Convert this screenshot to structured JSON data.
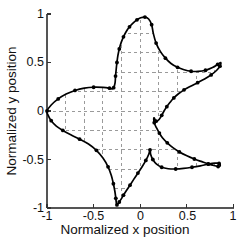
{
  "figure": {
    "background": "#ffffff",
    "axis_color": "#4d4d4d",
    "grid_color": "#9a9a9a",
    "curve_color": "#000000",
    "marker_color": "#000000"
  },
  "chart_data": {
    "type": "line",
    "title": "",
    "xlabel": "Normalized x position",
    "ylabel": "Normalized y position",
    "xlim": [
      -1,
      1
    ],
    "ylim": [
      -1,
      1
    ],
    "xticks": [
      -1,
      -0.5,
      0,
      0.5,
      1
    ],
    "yticks": [
      -1,
      -0.5,
      0,
      0.5,
      1
    ],
    "xtick_labels": [
      "-1",
      "-0.5",
      "0",
      "0.5",
      "1"
    ],
    "ytick_labels": [
      "-1",
      "-0.5",
      "0",
      "0.5",
      "1"
    ],
    "grid": true,
    "grid_style": "dashed",
    "grid_minor_step": 0.2,
    "legend": null,
    "annotations": [],
    "series": [
      {
        "name": "normalized cell outline",
        "style": "line-with-markers",
        "marker": "dot",
        "closed": true,
        "x": [
          -1.0,
          -0.955,
          -0.88,
          -0.795,
          -0.7,
          -0.6,
          -0.5,
          -0.4,
          -0.33,
          -0.3,
          -0.285,
          -0.27,
          -0.265,
          -0.258,
          -0.25,
          -0.24,
          -0.225,
          -0.205,
          -0.18,
          -0.15,
          -0.115,
          -0.075,
          -0.035,
          0.005,
          0.05,
          0.09,
          0.122,
          0.14,
          0.17,
          0.215,
          0.27,
          0.33,
          0.4,
          0.47,
          0.545,
          0.62,
          0.7,
          0.775,
          0.83,
          0.862,
          0.855,
          0.82,
          0.76,
          0.69,
          0.615,
          0.54,
          0.47,
          0.41,
          0.36,
          0.32,
          0.285,
          0.255,
          0.23,
          0.2,
          0.17,
          0.148,
          0.15,
          0.175,
          0.205,
          0.24,
          0.29,
          0.35,
          0.42,
          0.5,
          0.58,
          0.66,
          0.73,
          0.79,
          0.835,
          0.858,
          0.845,
          0.8,
          0.73,
          0.645,
          0.555,
          0.465,
          0.38,
          0.3,
          0.23,
          0.175,
          0.135,
          0.112,
          0.105,
          0.09,
          0.06,
          0.02,
          -0.025,
          -0.07,
          -0.11,
          -0.148,
          -0.18,
          -0.205,
          -0.225,
          -0.24,
          -0.25,
          -0.256,
          -0.262,
          -0.272,
          -0.288,
          -0.31,
          -0.345,
          -0.4,
          -0.47,
          -0.555,
          -0.65,
          -0.745,
          -0.83,
          -0.9,
          -0.955,
          -0.99
        ],
        "y": [
          0.0,
          0.062,
          0.125,
          0.175,
          0.212,
          0.235,
          0.245,
          0.243,
          0.235,
          0.228,
          0.24,
          0.29,
          0.36,
          0.43,
          0.5,
          0.57,
          0.64,
          0.705,
          0.765,
          0.82,
          0.868,
          0.908,
          0.94,
          0.962,
          0.968,
          0.948,
          0.89,
          0.8,
          0.7,
          0.615,
          0.545,
          0.49,
          0.45,
          0.425,
          0.41,
          0.408,
          0.42,
          0.448,
          0.48,
          0.5,
          0.462,
          0.42,
          0.372,
          0.33,
          0.292,
          0.255,
          0.218,
          0.178,
          0.135,
          0.09,
          0.045,
          0.0,
          -0.045,
          -0.09,
          -0.105,
          -0.07,
          -0.12,
          -0.175,
          -0.228,
          -0.278,
          -0.328,
          -0.378,
          -0.422,
          -0.462,
          -0.495,
          -0.522,
          -0.545,
          -0.562,
          -0.572,
          -0.565,
          -0.54,
          -0.538,
          -0.548,
          -0.565,
          -0.58,
          -0.592,
          -0.598,
          -0.595,
          -0.58,
          -0.548,
          -0.5,
          -0.448,
          -0.4,
          -0.448,
          -0.51,
          -0.575,
          -0.64,
          -0.705,
          -0.765,
          -0.82,
          -0.868,
          -0.908,
          -0.938,
          -0.958,
          -0.968,
          -0.95,
          -0.9,
          -0.83,
          -0.75,
          -0.665,
          -0.575,
          -0.485,
          -0.405,
          -0.34,
          -0.29,
          -0.245,
          -0.2,
          -0.155,
          -0.1,
          -0.04
        ]
      }
    ]
  },
  "axes": {
    "x_title": "Normalized x position",
    "y_title": "Normalized y position",
    "x_ticks": [
      {
        "value": -1,
        "label": "-1"
      },
      {
        "value": -0.5,
        "label": "-0.5"
      },
      {
        "value": 0,
        "label": "0"
      },
      {
        "value": 0.5,
        "label": "0.5"
      },
      {
        "value": 1,
        "label": "1"
      }
    ],
    "y_ticks": [
      {
        "value": 1,
        "label": "1"
      },
      {
        "value": 0.5,
        "label": "0.5"
      },
      {
        "value": 0,
        "label": "0"
      },
      {
        "value": -0.5,
        "label": "-0.5"
      },
      {
        "value": -1,
        "label": "-1"
      }
    ]
  }
}
